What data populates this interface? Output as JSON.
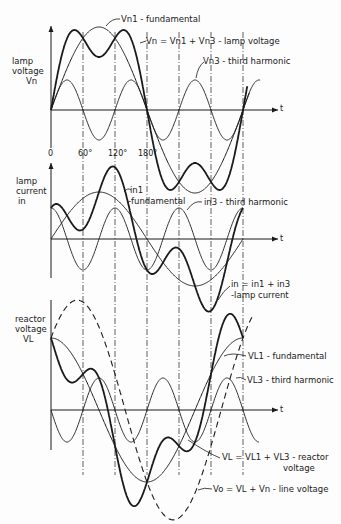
{
  "figure": {
    "x_ticks": [
      "0",
      "60°",
      "120°",
      "180°"
    ],
    "time_label": "t",
    "ink_color": "#1a1a1a",
    "background": "#fdfdfd"
  },
  "panels": [
    {
      "id": "lamp-voltage",
      "axis_label": [
        "lamp",
        "voltage",
        "Vn"
      ],
      "curves": [
        {
          "name": "Vn1 - fundamental",
          "expr": "83·sin θ",
          "style": "solid"
        },
        {
          "name": "Vn3 - third harmonic",
          "expr": "30·sin 3θ",
          "style": "thin"
        },
        {
          "name": "Vn = Vn1 + Vn3 - lamp voltage",
          "expr": "83·sin θ + 30·sin 3θ",
          "style": "bold"
        }
      ],
      "labels": [
        "Vn1 - fundamental",
        "Vn = Vn1 + Vn3 - lamp voltage",
        "Vn3 - third harmonic"
      ]
    },
    {
      "id": "lamp-current",
      "axis_label": [
        "lamp",
        "current",
        "in"
      ],
      "curves": [
        {
          "name": "in1 - fundamental",
          "expr": "47·sin θ",
          "style": "solid"
        },
        {
          "name": "in3 - third harmonic",
          "expr": "31·cos 3θ",
          "style": "thin"
        },
        {
          "name": "in = in1 + in3 - lamp current",
          "expr": "47·sin θ + 31·cos 3θ",
          "style": "bold"
        }
      ],
      "labels": [
        "in1",
        "-fundamental",
        "in3 - third harmonic",
        "in = in1 + in3",
        "-lamp current"
      ]
    },
    {
      "id": "reactor-voltage",
      "axis_label": [
        "reactor",
        "voltage",
        "VL"
      ],
      "curves": [
        {
          "name": "VL1 - fundamental",
          "expr": "72·cos θ",
          "style": "solid"
        },
        {
          "name": "VL3 - third harmonic",
          "expr": "-32·sin 3θ",
          "style": "thin"
        },
        {
          "name": "VL = VL1 + VL3 - reactor voltage",
          "expr": "72·cos θ - 32·sin 3θ",
          "style": "bold"
        },
        {
          "name": "Vo = VL + Vn - line voltage",
          "expr": "83·sin θ + 72·cos θ",
          "style": "dashed"
        }
      ],
      "labels": [
        "VL1 - fundamental",
        "VL3 - third harmonic",
        "VL = VL1 + VL3 - reactor",
        "voltage",
        "Vo = VL + Vn - line voltage"
      ]
    }
  ]
}
